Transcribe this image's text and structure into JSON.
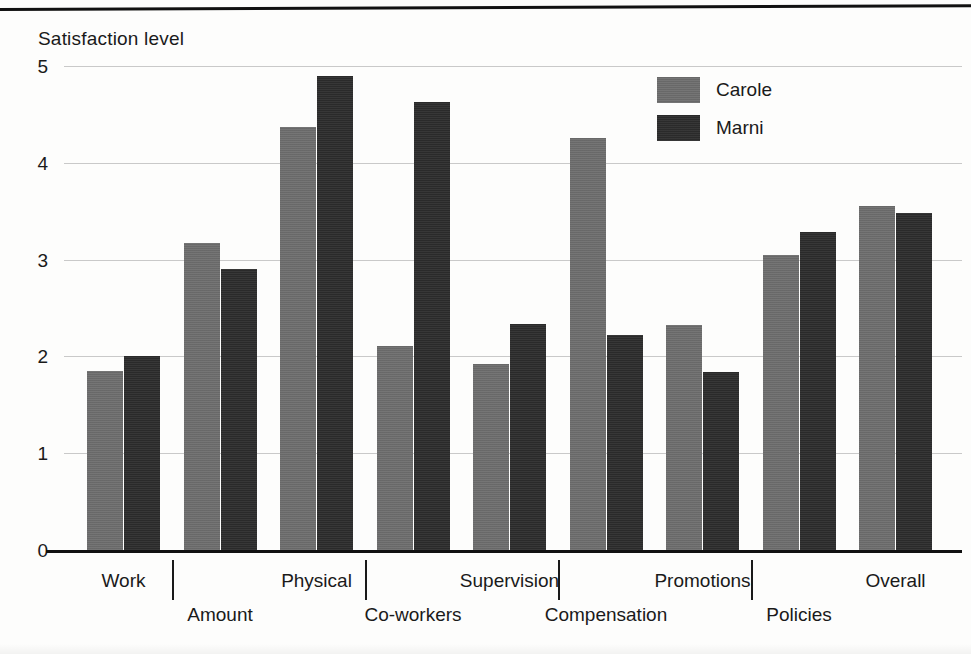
{
  "figure": {
    "y_axis_title": "Satisfaction level",
    "y_ticks": [
      "5",
      "4",
      "3",
      "2",
      "1",
      "0"
    ]
  },
  "legend": {
    "items": [
      {
        "label": "Carole",
        "color": "#6e6e6e"
      },
      {
        "label": "Marni",
        "color": "#2c2c2c"
      }
    ]
  },
  "chart_data": {
    "type": "bar",
    "title": "",
    "subtitle": "",
    "xlabel": "",
    "ylabel": "Satisfaction level",
    "ylim": [
      0,
      5
    ],
    "ytick_values": [
      0,
      1,
      2,
      3,
      4,
      5
    ],
    "grid": true,
    "legend_position": "top-right",
    "orientation": "vertical",
    "grouping": "grouped",
    "categories": [
      "Work",
      "Amount",
      "Physical",
      "Co-workers",
      "Supervision",
      "Compensation",
      "Promotions",
      "Policies",
      "Overall"
    ],
    "series": [
      {
        "name": "Carole",
        "color": "#6e6e6e",
        "values": [
          1.85,
          3.17,
          4.37,
          2.11,
          1.92,
          4.26,
          2.32,
          3.05,
          3.55
        ]
      },
      {
        "name": "Marni",
        "color": "#2c2c2c",
        "values": [
          2.0,
          2.9,
          4.9,
          4.63,
          2.33,
          2.22,
          1.84,
          3.29,
          3.48
        ]
      }
    ]
  }
}
